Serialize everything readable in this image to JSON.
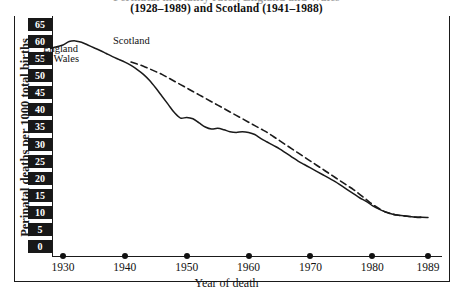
{
  "title": {
    "line1": "Perinatal mortality rates, England and Wales",
    "line2": "(1928–1989) and Scotland (1941–1988)"
  },
  "axes": {
    "y_title": "Perinatal deaths per 1000 total births",
    "x_title": "Year of death",
    "y_ticks": [
      "65",
      "60",
      "55",
      "50",
      "45",
      "40",
      "35",
      "30",
      "25",
      "20",
      "15",
      "10",
      "5",
      "0"
    ],
    "x_ticks": [
      "1930",
      "1940",
      "1950",
      "1960",
      "1970",
      "1980",
      "1989"
    ]
  },
  "legend": {
    "england_line1": "England",
    "england_line2": "& Wales",
    "scotland": "Scotland"
  },
  "colors": {
    "ink": "#1a1a1a",
    "chip_bg": "#181818",
    "chip_text": "#ffffff",
    "series_england": "#1a1a1a",
    "series_scotland": "#1a1a1a"
  },
  "chart_data": {
    "type": "line",
    "title": "Perinatal mortality rates, England and Wales (1928–1989) and Scotland (1941–1988)",
    "xlabel": "Year of death",
    "ylabel": "Perinatal deaths per 1000 total births",
    "xlim": [
      1928,
      1989
    ],
    "ylim": [
      0,
      65
    ],
    "yticks": [
      0,
      5,
      10,
      15,
      20,
      25,
      30,
      35,
      40,
      45,
      50,
      55,
      60,
      65
    ],
    "xticks": [
      1930,
      1940,
      1950,
      1960,
      1970,
      1980,
      1989
    ],
    "grid": false,
    "legend_position": "inline-annotations",
    "annotations": [
      {
        "text": "England & Wales",
        "x": 1929,
        "y": 55
      },
      {
        "text": "Scotland",
        "x": 1937,
        "y": 61
      }
    ],
    "series": [
      {
        "name": "England & Wales",
        "style": "solid",
        "x": [
          1928,
          1929,
          1930,
          1931,
          1932,
          1933,
          1934,
          1935,
          1936,
          1937,
          1938,
          1939,
          1940,
          1941,
          1942,
          1943,
          1944,
          1945,
          1946,
          1947,
          1948,
          1949,
          1950,
          1951,
          1952,
          1953,
          1954,
          1955,
          1956,
          1957,
          1958,
          1959,
          1960,
          1961,
          1962,
          1963,
          1964,
          1965,
          1966,
          1967,
          1968,
          1969,
          1970,
          1971,
          1972,
          1973,
          1974,
          1975,
          1976,
          1977,
          1978,
          1979,
          1980,
          1981,
          1982,
          1983,
          1984,
          1985,
          1986,
          1987,
          1988,
          1989
        ],
        "values": [
          58.0,
          58.5,
          59.0,
          60.0,
          60.2,
          59.8,
          59.0,
          58.2,
          57.4,
          56.5,
          55.6,
          54.8,
          54.0,
          53.0,
          51.8,
          50.4,
          48.6,
          46.4,
          44.0,
          41.6,
          39.2,
          37.6,
          37.8,
          37.4,
          36.2,
          35.0,
          34.4,
          34.6,
          34.2,
          33.6,
          33.4,
          33.6,
          33.4,
          32.8,
          31.6,
          30.6,
          29.6,
          28.6,
          27.4,
          26.2,
          25.0,
          24.0,
          23.0,
          22.0,
          21.0,
          20.0,
          19.0,
          17.8,
          16.6,
          15.4,
          14.2,
          13.2,
          12.0,
          11.0,
          10.2,
          9.6,
          9.2,
          9.0,
          8.8,
          8.6,
          8.6,
          8.5
        ]
      },
      {
        "name": "Scotland",
        "style": "dashed",
        "x": [
          1941,
          1942,
          1943,
          1944,
          1945,
          1946,
          1947,
          1948,
          1949,
          1950,
          1951,
          1952,
          1953,
          1954,
          1955,
          1956,
          1957,
          1958,
          1959,
          1960,
          1961,
          1962,
          1963,
          1964,
          1965,
          1966,
          1967,
          1968,
          1969,
          1970,
          1971,
          1972,
          1973,
          1974,
          1975,
          1976,
          1977,
          1978,
          1979,
          1980,
          1981,
          1982,
          1983,
          1984,
          1985,
          1986,
          1987,
          1988
        ],
        "values": [
          54.0,
          53.4,
          52.8,
          52.0,
          51.2,
          50.4,
          49.4,
          48.4,
          47.4,
          46.4,
          45.4,
          44.4,
          43.4,
          42.4,
          41.4,
          40.4,
          39.4,
          38.4,
          37.4,
          36.4,
          35.4,
          34.4,
          33.4,
          32.2,
          31.0,
          29.8,
          28.6,
          27.4,
          26.2,
          25.0,
          23.8,
          22.6,
          21.4,
          20.2,
          19.0,
          17.8,
          16.6,
          15.2,
          13.8,
          12.4,
          11.2,
          10.2,
          9.6,
          9.2,
          9.0,
          8.8,
          8.6,
          8.5
        ]
      }
    ]
  }
}
